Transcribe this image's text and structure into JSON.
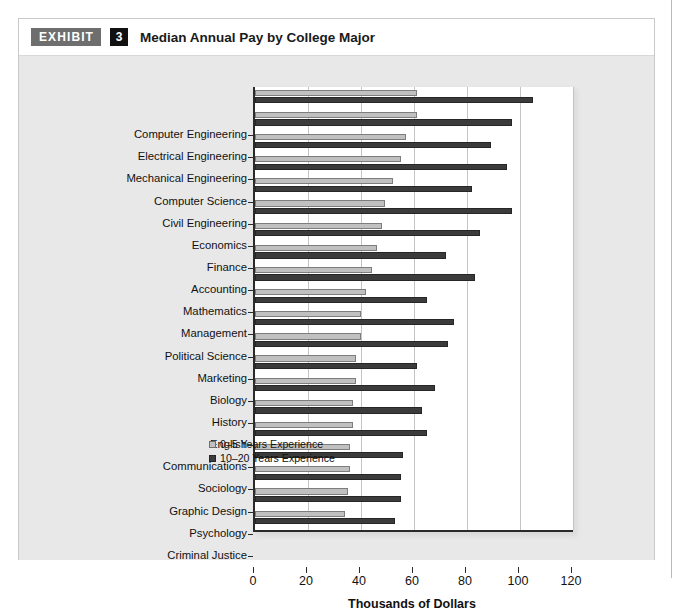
{
  "exhibit": {
    "tag": "EXHIBIT",
    "number": "3",
    "title": "Median Annual Pay by College Major"
  },
  "legend": {
    "series_1": "0–5 Years Experience",
    "series_2": "10–20 Years Experience"
  },
  "colors": {
    "series_1": "#c0c0c0",
    "series_2": "#3b3b3b",
    "plot_background": "#ffffff",
    "figure_background": "#e8e8e8",
    "axis": "#2b2b2b",
    "gridline": "#c4c4c4",
    "tag_background": "#6e6e6e",
    "number_background": "#111111"
  },
  "chart_data": {
    "type": "bar",
    "orientation": "horizontal",
    "title": "Median Annual Pay by College Major",
    "xlabel": "Thousands of Dollars",
    "ylabel": "",
    "xlim": [
      0,
      120
    ],
    "xticks": [
      0,
      20,
      40,
      60,
      80,
      100,
      120
    ],
    "xticklabels": [
      "0",
      "20",
      "40",
      "60",
      "80",
      "100",
      "120"
    ],
    "grid": "vertical",
    "legend_position": "inside lower right",
    "categories": [
      "Computer Engineering",
      "Electrical Engineering",
      "Mechanical Engineering",
      "Computer Science",
      "Civil Engineering",
      "Economics",
      "Finance",
      "Accounting",
      "Mathematics",
      "Management",
      "Political Science",
      "Marketing",
      "Biology",
      "History",
      "English",
      "Communications",
      "Sociology",
      "Graphic Design",
      "Psychology",
      "Criminal Justice"
    ],
    "series": [
      {
        "name": "0–5 Years Experience",
        "color": "#c0c0c0",
        "values": [
          61,
          61,
          57,
          55,
          52,
          49,
          48,
          46,
          44,
          42,
          40,
          40,
          38,
          38,
          37,
          37,
          36,
          36,
          35,
          34
        ]
      },
      {
        "name": "10–20 Years Experience",
        "color": "#3b3b3b",
        "values": [
          105,
          97,
          89,
          95,
          82,
          97,
          85,
          72,
          83,
          65,
          75,
          73,
          61,
          68,
          63,
          65,
          56,
          55,
          55,
          53
        ]
      }
    ]
  }
}
